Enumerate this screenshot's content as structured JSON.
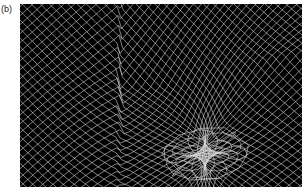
{
  "figure": {
    "panel_label": "(b)",
    "colors": {
      "background": "#000000",
      "mesh_lines": "#d8d8d8",
      "page": "#ffffff"
    }
  }
}
